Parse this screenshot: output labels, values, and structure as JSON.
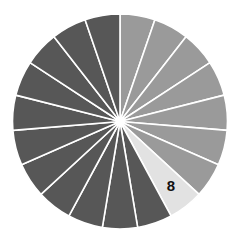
{
  "diagram": {
    "type": "divided-circle",
    "wedge_count": 19,
    "start_angle_deg": 0,
    "direction": "clockwise",
    "center": [
      120,
      121.5
    ],
    "radius": 107.5,
    "colors": {
      "group_a": "#9a9a9a",
      "highlight": "#e2e2e2",
      "group_b": "#575757",
      "separator": "#ffffff",
      "label": "#111111"
    },
    "wedges": [
      {
        "index": 1,
        "group": "group_a"
      },
      {
        "index": 2,
        "group": "group_a"
      },
      {
        "index": 3,
        "group": "group_a"
      },
      {
        "index": 4,
        "group": "group_a"
      },
      {
        "index": 5,
        "group": "group_a"
      },
      {
        "index": 6,
        "group": "group_a"
      },
      {
        "index": 7,
        "group": "group_a"
      },
      {
        "index": 8,
        "group": "highlight",
        "label": "8"
      },
      {
        "index": 9,
        "group": "group_b"
      },
      {
        "index": 10,
        "group": "group_b"
      },
      {
        "index": 11,
        "group": "group_b"
      },
      {
        "index": 12,
        "group": "group_b"
      },
      {
        "index": 13,
        "group": "group_b"
      },
      {
        "index": 14,
        "group": "group_b"
      },
      {
        "index": 15,
        "group": "group_b"
      },
      {
        "index": 16,
        "group": "group_b"
      },
      {
        "index": 17,
        "group": "group_b"
      },
      {
        "index": 18,
        "group": "group_b"
      },
      {
        "index": 19,
        "group": "group_b"
      }
    ],
    "highlight_label": "8"
  }
}
